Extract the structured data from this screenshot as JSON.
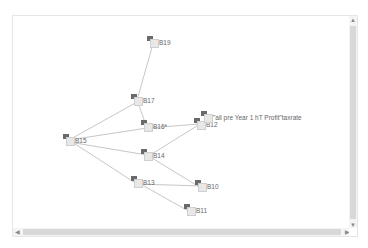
{
  "diagram": {
    "nodes": [
      {
        "id": "B19",
        "label": "B19",
        "x": 134,
        "y": 20
      },
      {
        "id": "B17",
        "label": "B17",
        "x": 118,
        "y": 78
      },
      {
        "id": "B16",
        "label": "B16*",
        "x": 128,
        "y": 104
      },
      {
        "id": "B15",
        "label": "B15",
        "x": 50,
        "y": 118
      },
      {
        "id": "B14",
        "label": "B14",
        "x": 128,
        "y": 133
      },
      {
        "id": "B13",
        "label": "B13",
        "x": 118,
        "y": 160
      },
      {
        "id": "B10",
        "label": "B10",
        "x": 182,
        "y": 164
      },
      {
        "id": "B11",
        "label": "B11",
        "x": 171,
        "y": 188
      },
      {
        "id": "B12",
        "label": "B12",
        "x": 181,
        "y": 102
      },
      {
        "id": "taxrate",
        "label": "\"all pre Year 1 hT Profit\"taxrate",
        "x": 188,
        "y": 95
      }
    ],
    "edges": [
      {
        "from": "B17",
        "to": "B19"
      },
      {
        "from": "B15",
        "to": "B17"
      },
      {
        "from": "B17",
        "to": "B16"
      },
      {
        "from": "B15",
        "to": "B16"
      },
      {
        "from": "B12",
        "to": "B16"
      },
      {
        "from": "B14",
        "to": "B15"
      },
      {
        "from": "B12",
        "to": "B14"
      },
      {
        "from": "B14",
        "to": "B10"
      },
      {
        "from": "B15",
        "to": "B13"
      },
      {
        "from": "B10",
        "to": "B13"
      },
      {
        "from": "B13",
        "to": "B11"
      }
    ]
  },
  "scrollbars": {
    "up_arrow": "▲",
    "down_arrow": "▼",
    "left_arrow": "◀",
    "right_arrow": "▶"
  },
  "colors": {
    "edge": "#b8b8b8",
    "label": "#666666",
    "icon_dark": "#6a6a6a"
  }
}
